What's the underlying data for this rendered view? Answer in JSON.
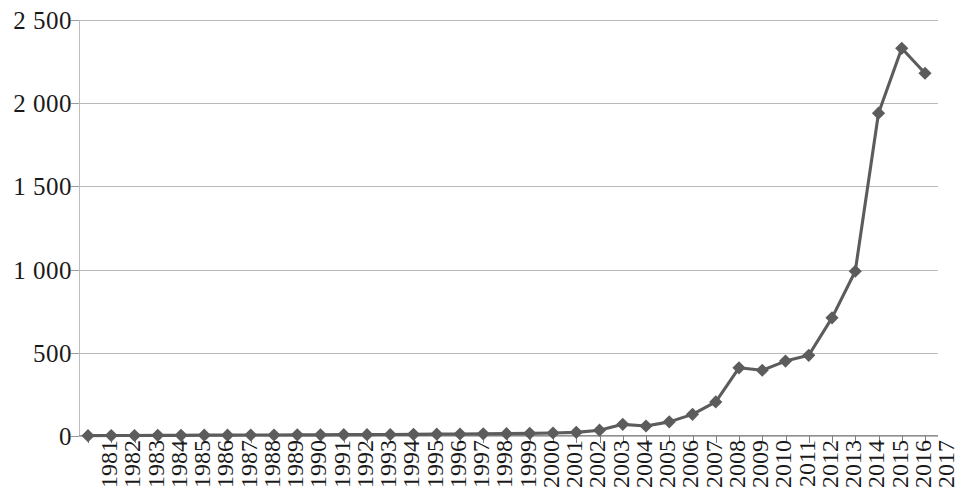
{
  "chart_data": {
    "type": "line",
    "title": "",
    "subtitle": "",
    "xlabel": "",
    "ylabel": "",
    "ylim": [
      0,
      2500
    ],
    "y_ticks": [
      0,
      500,
      1000,
      1500,
      2000,
      2500
    ],
    "y_tick_labels": [
      "0",
      "500",
      "1 000",
      "1 500",
      "2 000",
      "2 500"
    ],
    "grid": "horizontal",
    "legend": "none",
    "marker": "diamond",
    "series_color": "#5c5c5c",
    "grid_color": "#b9b9b9",
    "categories": [
      "1981",
      "1982",
      "1983",
      "1984",
      "1985",
      "1986",
      "1987",
      "1988",
      "1989",
      "1990",
      "1991",
      "1992",
      "1993",
      "1994",
      "1995",
      "1996",
      "1997",
      "1998",
      "1999",
      "2000",
      "2001",
      "2002",
      "2003",
      "2004",
      "2005",
      "2006",
      "2007",
      "2008",
      "2009",
      "2010",
      "2011",
      "2012",
      "2013",
      "2014",
      "2015",
      "2016",
      "2017"
    ],
    "series": [
      {
        "name": "",
        "values": [
          2,
          3,
          3,
          4,
          4,
          5,
          5,
          6,
          6,
          7,
          7,
          8,
          8,
          9,
          10,
          11,
          12,
          13,
          14,
          16,
          18,
          22,
          35,
          70,
          60,
          85,
          130,
          205,
          410,
          395,
          450,
          485,
          710,
          990,
          1940,
          2330,
          2180
        ]
      }
    ]
  }
}
